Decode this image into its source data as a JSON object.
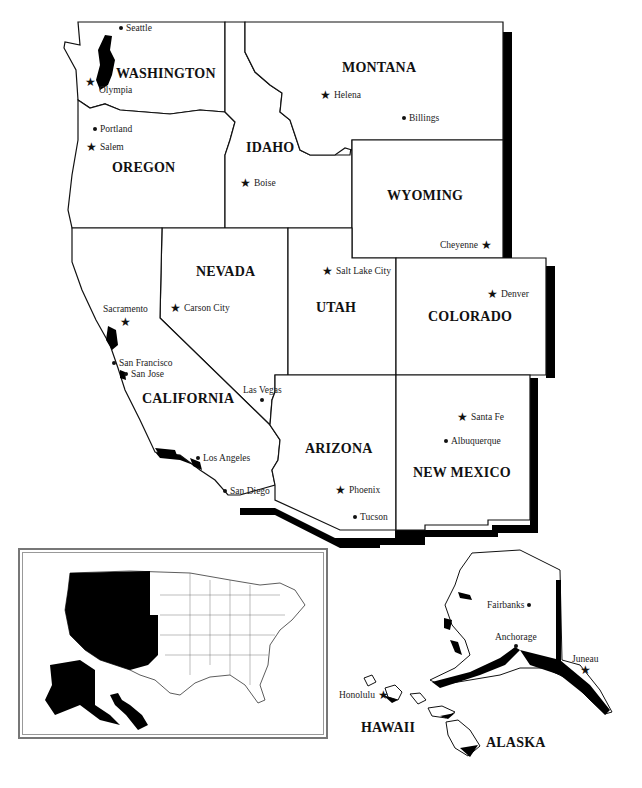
{
  "map": {
    "title": "Western United States",
    "colors": {
      "fill": "#ffffff",
      "border": "#111111",
      "shadow": "#000000",
      "inset_highlight": "#000000"
    },
    "states": [
      {
        "name": "WASHINGTON",
        "capital": "Olympia",
        "cities": [
          "Seattle"
        ]
      },
      {
        "name": "OREGON",
        "capital": "Salem",
        "cities": [
          "Portland"
        ]
      },
      {
        "name": "IDAHO",
        "capital": "Boise",
        "cities": []
      },
      {
        "name": "MONTANA",
        "capital": "Helena",
        "cities": [
          "Billings"
        ]
      },
      {
        "name": "WYOMING",
        "capital": "Cheyenne",
        "cities": []
      },
      {
        "name": "NEVADA",
        "capital": "Carson City",
        "cities": [
          "Las Vegas"
        ]
      },
      {
        "name": "UTAH",
        "capital": "Salt Lake City",
        "cities": []
      },
      {
        "name": "COLORADO",
        "capital": "Denver",
        "cities": []
      },
      {
        "name": "CALIFORNIA",
        "capital": "Sacramento",
        "cities": [
          "San Francisco",
          "San Jose",
          "Los Angeles",
          "San Diego"
        ]
      },
      {
        "name": "ARIZONA",
        "capital": "Phoenix",
        "cities": [
          "Tucson"
        ]
      },
      {
        "name": "NEW MEXICO",
        "capital": "Santa Fe",
        "cities": [
          "Albuquerque"
        ]
      },
      {
        "name": "ALASKA",
        "capital": "Juneau",
        "cities": [
          "Fairbanks",
          "Anchorage"
        ]
      },
      {
        "name": "HAWAII",
        "capital": "Honolulu",
        "cities": []
      }
    ],
    "labels": {
      "washington": "WASHINGTON",
      "oregon": "OREGON",
      "idaho": "IDAHO",
      "montana": "MONTANA",
      "wyoming": "WYOMING",
      "nevada": "NEVADA",
      "utah": "UTAH",
      "colorado": "COLORADO",
      "california": "CALIFORNIA",
      "arizona": "ARIZONA",
      "new_mexico": "NEW MEXICO",
      "alaska": "ALASKA",
      "hawaii": "HAWAII"
    },
    "cities": {
      "seattle": "Seattle",
      "olympia": "Olympia",
      "portland": "Portland",
      "salem": "Salem",
      "boise": "Boise",
      "helena": "Helena",
      "billings": "Billings",
      "cheyenne": "Cheyenne",
      "carson_city": "Carson City",
      "sacramento": "Sacramento",
      "salt_lake_city": "Salt Lake City",
      "denver": "Denver",
      "san_francisco": "San Francisco",
      "san_jose": "San Jose",
      "las_vegas": "Las Vegas",
      "los_angeles": "Los Angeles",
      "san_diego": "San Diego",
      "phoenix": "Phoenix",
      "tucson": "Tucson",
      "santa_fe": "Santa Fe",
      "albuquerque": "Albuquerque",
      "fairbanks": "Fairbanks",
      "anchorage": "Anchorage",
      "juneau": "Juneau",
      "honolulu": "Honolulu"
    },
    "legend": {
      "capital_icon": "star-icon",
      "city_icon": "dot-icon"
    },
    "inset": {
      "description": "US locator map with western states highlighted in black"
    }
  }
}
